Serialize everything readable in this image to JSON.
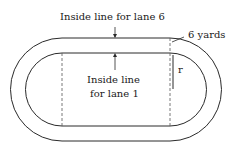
{
  "diagram": {
    "type": "running-track",
    "labels": {
      "outer_line": "Inside line for lane 6",
      "inner_line_1": "Inside line",
      "inner_line_2": "for lane 1",
      "width": "6 yards",
      "radius": "r"
    },
    "colors": {
      "stroke": "#2a2a2a",
      "dashed": "#555555",
      "background": "#ffffff"
    }
  }
}
